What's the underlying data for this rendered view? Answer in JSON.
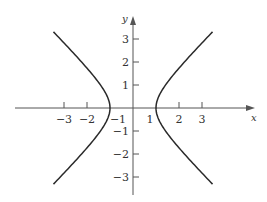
{
  "chart_data": {
    "type": "line",
    "title": "",
    "equation": "x^2 - y^2 = 1",
    "xlabel": "x",
    "ylabel": "y",
    "xlim": [
      -5.8,
      5.6
    ],
    "ylim": [
      -3.8,
      3.6
    ],
    "grid": false,
    "legend": null,
    "x_ticks": [
      -3,
      -2,
      -1,
      1,
      2,
      3
    ],
    "x_tick_labels": [
      "−3",
      "−2",
      "−1",
      "1",
      "2",
      "3"
    ],
    "y_ticks": [
      3,
      2,
      1,
      -1,
      -2,
      -3
    ],
    "y_tick_labels": [
      "3",
      "2",
      "1",
      "−1",
      "−2",
      "−3"
    ],
    "series": [
      {
        "name": "right branch",
        "points": [
          [
            3.46,
            3.31
          ],
          [
            2.83,
            2.65
          ],
          [
            2.24,
            2.0
          ],
          [
            1.8,
            1.5
          ],
          [
            1.41,
            1.0
          ],
          [
            1.12,
            0.5
          ],
          [
            1.0,
            0.0
          ],
          [
            1.12,
            -0.5
          ],
          [
            1.41,
            -1.0
          ],
          [
            1.8,
            -1.5
          ],
          [
            2.24,
            -2.0
          ],
          [
            2.83,
            -2.65
          ],
          [
            3.46,
            -3.31
          ]
        ]
      },
      {
        "name": "left branch",
        "points": [
          [
            -3.46,
            3.31
          ],
          [
            -2.83,
            2.65
          ],
          [
            -2.24,
            2.0
          ],
          [
            -1.8,
            1.5
          ],
          [
            -1.41,
            1.0
          ],
          [
            -1.12,
            0.5
          ],
          [
            -1.0,
            0.0
          ],
          [
            -1.12,
            -0.5
          ],
          [
            -1.41,
            -1.0
          ],
          [
            -1.8,
            -1.5
          ],
          [
            -2.24,
            -2.0
          ],
          [
            -2.83,
            -2.65
          ],
          [
            -3.46,
            -3.31
          ]
        ]
      }
    ],
    "vertices": [
      [
        -1,
        0
      ],
      [
        1,
        0
      ]
    ]
  },
  "colors": {
    "curve": "#2a2a2a",
    "axis": "#555555",
    "text": "#333333"
  }
}
